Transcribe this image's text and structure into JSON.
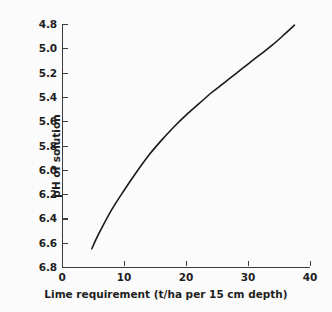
{
  "chart_data": {
    "type": "line",
    "title": "",
    "xlabel": "Lime requirement (t/ha per 15 cm depth)",
    "ylabel": "pH of solution",
    "xlim": [
      0,
      40
    ],
    "ylim": [
      6.8,
      4.8
    ],
    "y_axis_inverted": true,
    "grid": false,
    "legend": null,
    "xticks": [
      0,
      10,
      20,
      30,
      40
    ],
    "xtick_labels": [
      "0",
      "10",
      "20",
      "30",
      "40"
    ],
    "yticks": [
      4.8,
      5.0,
      5.2,
      5.4,
      5.6,
      5.8,
      6.0,
      6.2,
      6.4,
      6.6,
      6.8
    ],
    "ytick_labels": [
      "4.8",
      "5.0",
      "5.2",
      "5.4",
      "5.6",
      "5.8",
      "6.0",
      "6.2",
      "6.4",
      "6.6",
      "6.8"
    ],
    "series": [
      {
        "name": "pH vs lime requirement",
        "color": "#1a1a1a",
        "x": [
          4.8,
          6.0,
          8.0,
          10.0,
          12.0,
          14.0,
          16.0,
          18.0,
          20.0,
          22.0,
          24.0,
          26.0,
          28.0,
          30.0,
          32.0,
          34.0,
          36.0,
          37.5
        ],
        "y": [
          6.65,
          6.52,
          6.33,
          6.17,
          6.02,
          5.88,
          5.76,
          5.65,
          5.55,
          5.46,
          5.37,
          5.29,
          5.21,
          5.13,
          5.05,
          4.97,
          4.88,
          4.81
        ]
      }
    ]
  },
  "axes": {
    "tick_color": "#3b3b3b",
    "label_color": "#1e1e1e",
    "background": "#fbfbfb"
  }
}
